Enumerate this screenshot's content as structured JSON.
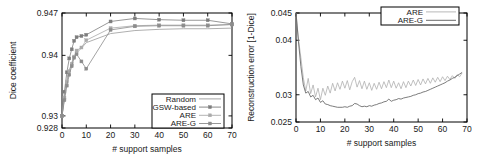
{
  "figure": {
    "background": "#ffffff",
    "panel_count": 2
  },
  "chart_data": [
    {
      "type": "line",
      "panel": "left",
      "title": "",
      "xlabel": "# support samples",
      "ylabel": "Dice coefficient",
      "xlim": [
        0,
        70
      ],
      "ylim": [
        0.928,
        0.947
      ],
      "xticks": [
        0,
        10,
        20,
        30,
        40,
        50,
        60,
        70
      ],
      "xtick_labels": [
        "0",
        "10",
        "20",
        "30",
        "40",
        "50",
        "60",
        "70"
      ],
      "yticks": [
        0.928,
        0.93,
        0.94,
        0.947
      ],
      "ytick_labels": [
        "0.928",
        "0.93",
        "0.94",
        "0.947"
      ],
      "grid": false,
      "legend_position": "bottom-right",
      "series": [
        {
          "name": "Random",
          "color": "#9a9a9a",
          "marker": "none",
          "x": [
            0,
            1,
            2,
            3,
            4,
            5,
            6,
            8,
            10,
            20,
            30,
            40,
            50,
            60,
            70
          ],
          "values": [
            0.93,
            0.9332,
            0.9358,
            0.9375,
            0.9388,
            0.9398,
            0.9404,
            0.9412,
            0.9421,
            0.9436,
            0.9441,
            0.9443,
            0.9444,
            0.9444,
            0.9445
          ]
        },
        {
          "name": "GSW-based",
          "color": "#7d7d7d",
          "marker": "square",
          "x": [
            0,
            1,
            2,
            3,
            4,
            5,
            6,
            8,
            10,
            20,
            30,
            40,
            50,
            60,
            70
          ],
          "values": [
            0.93,
            0.934,
            0.9372,
            0.9395,
            0.941,
            0.9424,
            0.943,
            0.9432,
            0.9434,
            0.9456,
            0.9461,
            0.9459,
            0.9458,
            0.9458,
            0.9452
          ]
        },
        {
          "name": "ARE",
          "color": "#aaaaaa",
          "marker": "square",
          "x": [
            0,
            1,
            2,
            3,
            4,
            5,
            6,
            8,
            10,
            20,
            30,
            40,
            50,
            60,
            70
          ],
          "values": [
            0.93,
            0.933,
            0.9356,
            0.9374,
            0.9386,
            0.9398,
            0.9408,
            0.9413,
            0.9425,
            0.9445,
            0.9449,
            0.945,
            0.945,
            0.945,
            0.9451
          ]
        },
        {
          "name": "ARE-G",
          "color": "#8c8c8c",
          "marker": "square",
          "x": [
            0,
            1,
            2,
            3,
            4,
            5,
            6,
            8,
            10,
            20,
            30,
            40,
            50,
            60,
            70
          ],
          "values": [
            0.93,
            0.9326,
            0.935,
            0.9368,
            0.9382,
            0.9396,
            0.9402,
            0.939,
            0.9378,
            0.9442,
            0.9448,
            0.9449,
            0.9449,
            0.9449,
            0.9451
          ]
        }
      ]
    },
    {
      "type": "line",
      "panel": "right",
      "title": "",
      "xlabel": "# support samples",
      "ylabel": "Reconstruction error [1-Dice]",
      "xlim": [
        0,
        70
      ],
      "ylim": [
        0.025,
        0.045
      ],
      "xticks": [
        0,
        10,
        20,
        30,
        40,
        50,
        60,
        70
      ],
      "xtick_labels": [
        "0",
        "10",
        "20",
        "30",
        "40",
        "50",
        "60",
        "70"
      ],
      "yticks": [
        0.025,
        0.03,
        0.04,
        0.045
      ],
      "ytick_labels": [
        "0.025",
        "0.03",
        "0.04",
        "0.045"
      ],
      "grid": false,
      "legend_position": "top-right",
      "series": [
        {
          "name": "ARE",
          "color": "#b0b0b0",
          "marker": "none",
          "x": [
            0,
            1,
            2,
            3,
            4,
            5,
            6,
            7,
            8,
            9,
            10,
            11,
            12,
            13,
            14,
            15,
            16,
            17,
            18,
            19,
            20,
            21,
            22,
            23,
            24,
            25,
            26,
            27,
            28,
            29,
            30,
            31,
            32,
            33,
            34,
            35,
            36,
            37,
            38,
            39,
            40,
            41,
            42,
            43,
            44,
            45,
            46,
            47,
            48,
            49,
            50,
            51,
            52,
            53,
            54,
            55,
            56,
            57,
            58,
            59,
            60,
            61,
            62,
            63,
            64,
            65,
            66,
            67,
            68
          ],
          "values": [
            0.045,
            0.0402,
            0.0368,
            0.0331,
            0.0307,
            0.033,
            0.0302,
            0.0318,
            0.0296,
            0.0312,
            0.0291,
            0.0312,
            0.0299,
            0.0316,
            0.0303,
            0.0321,
            0.0307,
            0.0322,
            0.031,
            0.0325,
            0.0312,
            0.0326,
            0.0309,
            0.0324,
            0.0332,
            0.0314,
            0.0326,
            0.0311,
            0.0325,
            0.031,
            0.0322,
            0.0308,
            0.0321,
            0.031,
            0.0323,
            0.0311,
            0.0324,
            0.0313,
            0.0327,
            0.0313,
            0.0325,
            0.0312,
            0.0322,
            0.0311,
            0.0324,
            0.0313,
            0.0325,
            0.0316,
            0.0327,
            0.0317,
            0.0328,
            0.0318,
            0.0329,
            0.032,
            0.033,
            0.0321,
            0.0331,
            0.0323,
            0.0332,
            0.0324,
            0.0333,
            0.0326,
            0.0334,
            0.0328,
            0.0335,
            0.033,
            0.0337,
            0.0333,
            0.034
          ]
        },
        {
          "name": "ARE-G",
          "color": "#5a5a5a",
          "marker": "none",
          "x": [
            0,
            1,
            2,
            3,
            4,
            5,
            6,
            7,
            8,
            9,
            10,
            11,
            12,
            13,
            14,
            15,
            16,
            17,
            18,
            19,
            20,
            21,
            22,
            23,
            24,
            25,
            26,
            27,
            28,
            29,
            30,
            31,
            32,
            33,
            34,
            35,
            36,
            37,
            38,
            39,
            40,
            41,
            42,
            43,
            44,
            45,
            46,
            47,
            48,
            49,
            50,
            51,
            52,
            53,
            54,
            55,
            56,
            57,
            58,
            59,
            60,
            61,
            62,
            63,
            64,
            65,
            66,
            67,
            68
          ],
          "values": [
            0.045,
            0.0398,
            0.0352,
            0.0318,
            0.0303,
            0.0306,
            0.0296,
            0.0299,
            0.0291,
            0.0294,
            0.0286,
            0.0289,
            0.0283,
            0.0282,
            0.028,
            0.0279,
            0.0278,
            0.0277,
            0.0277,
            0.0277,
            0.0278,
            0.0277,
            0.0279,
            0.028,
            0.0284,
            0.0283,
            0.028,
            0.0278,
            0.0279,
            0.0278,
            0.028,
            0.0279,
            0.0281,
            0.0282,
            0.0284,
            0.0285,
            0.0287,
            0.0288,
            0.0292,
            0.0288,
            0.029,
            0.0291,
            0.0293,
            0.0292,
            0.0294,
            0.0295,
            0.0296,
            0.0297,
            0.0299,
            0.03,
            0.0302,
            0.0303,
            0.0305,
            0.0306,
            0.0308,
            0.031,
            0.0312,
            0.0314,
            0.0316,
            0.0318,
            0.032,
            0.0322,
            0.0325,
            0.0327,
            0.033,
            0.0332,
            0.0335,
            0.0338,
            0.0341
          ]
        }
      ]
    }
  ]
}
